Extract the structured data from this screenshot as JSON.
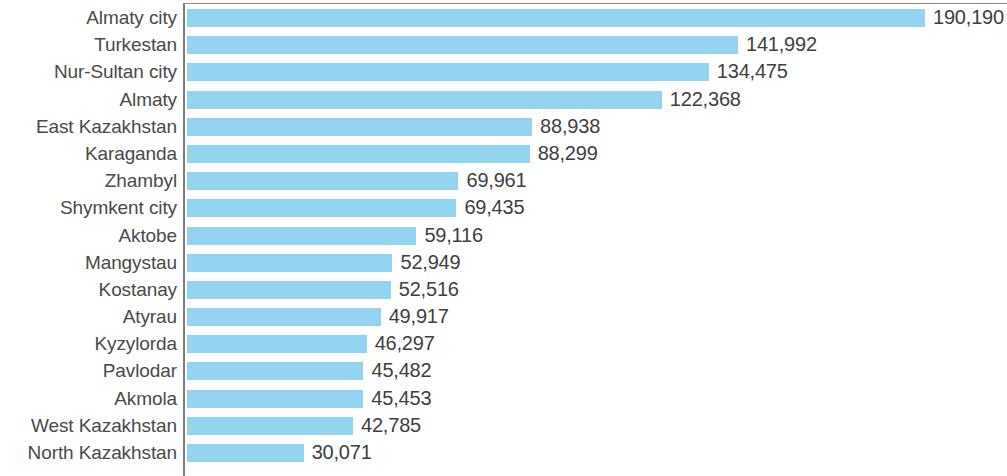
{
  "chart_data": {
    "type": "bar",
    "orientation": "horizontal",
    "title": "",
    "subtitle": "",
    "xlabel": "",
    "ylabel": "",
    "grid": false,
    "legend": null,
    "legend_position": "none",
    "xlim": [
      0,
      190190
    ],
    "bar_color": "#93d4f1",
    "text_color": "#4a4a4a",
    "axis_color": "#7d7d7d",
    "categories": [
      "Almaty city",
      "Turkestan",
      "Nur-Sultan city",
      "Almaty",
      "East Kazakhstan",
      "Karaganda",
      "Zhambyl",
      "Shymkent city",
      "Aktobe",
      "Mangystau",
      "Kostanay",
      "Atyrau",
      "Kyzylorda",
      "Pavlodar",
      "Akmola",
      "West Kazakhstan",
      "North Kazakhstan"
    ],
    "values": [
      190190,
      141992,
      134475,
      122368,
      88938,
      88299,
      69961,
      69435,
      59116,
      52949,
      52516,
      49917,
      46297,
      45482,
      45453,
      42785,
      30071
    ],
    "value_labels": [
      "190,190",
      "141,992",
      "134,475",
      "122,368",
      "88,938",
      "88,299",
      "69,961",
      "69,435",
      "59,116",
      "52,949",
      "52,516",
      "49,917",
      "46,297",
      "45,482",
      "45,453",
      "42,785",
      "30,071"
    ]
  }
}
